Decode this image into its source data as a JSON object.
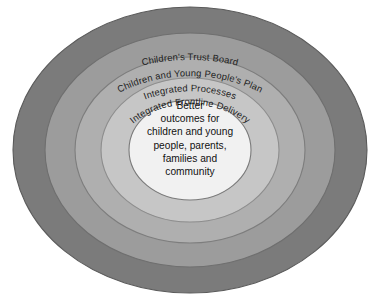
{
  "diagram": {
    "background_color": "#ffffff",
    "center": {
      "cx": 190,
      "cy": 150
    },
    "rings": [
      {
        "id": "childrens-trust-board",
        "label": "Children's Trust Board",
        "level": 1,
        "fill": "#7b7b7b",
        "stroke": "#5a5a5a",
        "rx": 177,
        "ry": 143,
        "label_arc_ry_factor": 0.8
      },
      {
        "id": "children-and-young-peoples-plan",
        "label": "Children and Young People's Plan",
        "level": 2,
        "fill": "#9c9c9c",
        "stroke": "#6f6f6f",
        "rx": 145,
        "ry": 117,
        "label_arc_ry_factor": 0.8
      },
      {
        "id": "integrated-processes",
        "label": "Integrated Processes",
        "level": 3,
        "fill": "#afafaf",
        "stroke": "#7d7d7d",
        "rx": 115,
        "ry": 93,
        "label_arc_ry_factor": 0.8
      },
      {
        "id": "integrated-frontline-delivery",
        "label": "Integrated Frontline Delivery",
        "level": 4,
        "fill": "#c6c6c6",
        "stroke": "#8d8d8d",
        "rx": 89,
        "ry": 72,
        "label_arc_ry_factor": 0.8
      },
      {
        "id": "better-outcomes-core",
        "label": "",
        "level": 5,
        "fill": "#f1f1f1",
        "stroke": "#7a7a7a",
        "rx": 61,
        "ry": 50,
        "label_arc_ry_factor": 0.8
      }
    ],
    "center_text": {
      "id": "better-outcomes",
      "lines": [
        "Better",
        "outcomes for",
        "children and young",
        "people, parents,",
        "families and",
        "community"
      ]
    }
  }
}
